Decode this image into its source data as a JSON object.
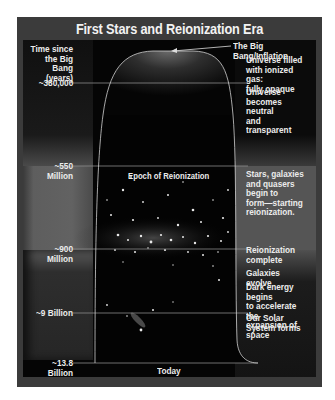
{
  "title": "First Stars and Reionization Era",
  "axis_label": "Time since\nthe Big Bang\n(years)",
  "bottom_label": "Today",
  "epoch_label": "Epoch of Reionization",
  "time_markers": [
    {
      "label": "~380,000"
    },
    {
      "label": "~550 Million"
    },
    {
      "label": "~900 Million"
    },
    {
      "label": "~9 Billion"
    },
    {
      "label": "~13.8 Billion"
    }
  ],
  "annotations": {
    "big_bang": "The Big Bang/Inflation",
    "ionized": "Universe filled\nwith ionized gas:\nfully opaque",
    "neutral": "Universe\nbecomes neutral\nand transparent",
    "stars_form": "Stars, galaxies\nand quasers\nbegin to\nform—starting\nreionization.",
    "reion_complete": "Reionization\ncomplete",
    "galaxies_evolve": "Galaxies evolve",
    "dark_energy": "Dark energy begins\nto accelerate the\nexpansion of space",
    "solar_system": "Our Solar\nSystem forms"
  },
  "colors": {
    "frame": "#3b3b3b",
    "background": "#050505",
    "band_grey": "#5a5a5a",
    "text": "#ececec",
    "line": "#8a8a8a"
  }
}
